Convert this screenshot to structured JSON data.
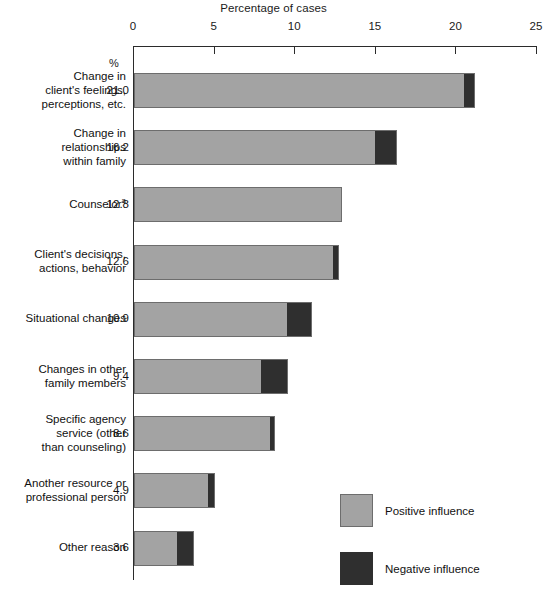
{
  "chart_data": {
    "type": "bar",
    "orientation": "horizontal",
    "stacked": true,
    "title": "Percentage of cases",
    "xlabel": "Percentage of cases",
    "ylabel": "",
    "xlim": [
      0,
      25
    ],
    "xticks": [
      0,
      5,
      10,
      15,
      20,
      25
    ],
    "xtick_labels": [
      "0",
      "5",
      "10",
      "15",
      "20",
      "25"
    ],
    "grid": false,
    "value_column_heading": "%",
    "categories": [
      "Change in client's feelings, perceptions, etc.",
      "Change in relationships within family",
      "Counselor",
      "Client's decisions, actions, behavior",
      "Situational changes",
      "Changes in other family members",
      "Specific agency service (other than counseling)",
      "Another resource or professional person",
      "Other reason"
    ],
    "totals": [
      21.0,
      16.2,
      12.8,
      12.6,
      10.9,
      9.4,
      8.6,
      4.9,
      3.6
    ],
    "series": [
      {
        "name": "Positive influence",
        "color": "#a3a3a3",
        "values": [
          20.4,
          14.9,
          12.8,
          12.3,
          9.4,
          7.8,
          8.4,
          4.5,
          2.6
        ]
      },
      {
        "name": "Negative influence",
        "color": "#2f2f2f",
        "values": [
          0.6,
          1.3,
          0.0,
          0.3,
          1.5,
          1.6,
          0.2,
          0.4,
          1.0
        ]
      }
    ],
    "legend": {
      "position": "bottom-right",
      "entries": [
        "Positive influence",
        "Negative influence"
      ]
    },
    "footnote_markers": {
      "counselor": "a"
    }
  },
  "title": "Percentage of cases",
  "axis": {
    "ticks": [
      {
        "label": "0",
        "value": 0
      },
      {
        "label": "5",
        "value": 5
      },
      {
        "label": "10",
        "value": 10
      },
      {
        "label": "15",
        "value": 15
      },
      {
        "label": "20",
        "value": 20
      },
      {
        "label": "25",
        "value": 25
      }
    ]
  },
  "percent_heading": "%",
  "rows": [
    {
      "label_lines": [
        "Change in",
        "client's feelings,",
        "perceptions, etc."
      ],
      "line1": "Change in",
      "line2": "client's feelings,",
      "line3": "perceptions, etc.",
      "value": "21.0",
      "superscript": ""
    },
    {
      "label_lines": [
        "Change in",
        "relationships",
        "within family"
      ],
      "line1": "Change in",
      "line2": "relationships",
      "line3": "within family",
      "value": "16.2",
      "superscript": ""
    },
    {
      "label_lines": [
        "Counselor"
      ],
      "line1": "Counselor",
      "line2": "",
      "line3": "",
      "value": "12.8",
      "superscript": "a"
    },
    {
      "label_lines": [
        "Client's decisions,",
        "actions, behavior"
      ],
      "line1": "Client's decisions,",
      "line2": "actions, behavior",
      "line3": "",
      "value": "12.6",
      "superscript": ""
    },
    {
      "label_lines": [
        "Situational changes"
      ],
      "line1": "Situational changes",
      "line2": "",
      "line3": "",
      "value": "10.9",
      "superscript": ""
    },
    {
      "label_lines": [
        "Changes in other",
        "family members"
      ],
      "line1": "Changes in other",
      "line2": "family members",
      "line3": "",
      "value": "9.4",
      "superscript": ""
    },
    {
      "label_lines": [
        "Specific agency",
        "service (other",
        "than counseling)"
      ],
      "line1": "Specific agency",
      "line2": "service (other",
      "line3": "than counseling)",
      "value": "8.6",
      "superscript": ""
    },
    {
      "label_lines": [
        "Another resource or",
        "professional person"
      ],
      "line1": "Another resource or",
      "line2": "professional person",
      "line3": "",
      "value": "4.9",
      "superscript": ""
    },
    {
      "label_lines": [
        "Other reason"
      ],
      "line1": "Other reason",
      "line2": "",
      "line3": "",
      "value": "3.6",
      "superscript": ""
    }
  ],
  "legend": {
    "positive_label": "Positive influence",
    "negative_label": "Negative influence",
    "positive_color": "#a3a3a3",
    "negative_color": "#2f2f2f"
  }
}
